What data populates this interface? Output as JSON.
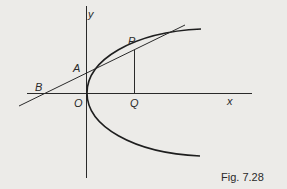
{
  "diagram": {
    "type": "parabola-tangent",
    "labels": {
      "y_axis": "y",
      "x_axis": "x",
      "origin": "O",
      "point_a": "A",
      "point_b": "B",
      "point_p": "P",
      "point_q": "Q"
    },
    "caption": "Fig. 7.28",
    "colors": {
      "background": "#ecebe8",
      "ink": "#2a2a2a"
    }
  }
}
